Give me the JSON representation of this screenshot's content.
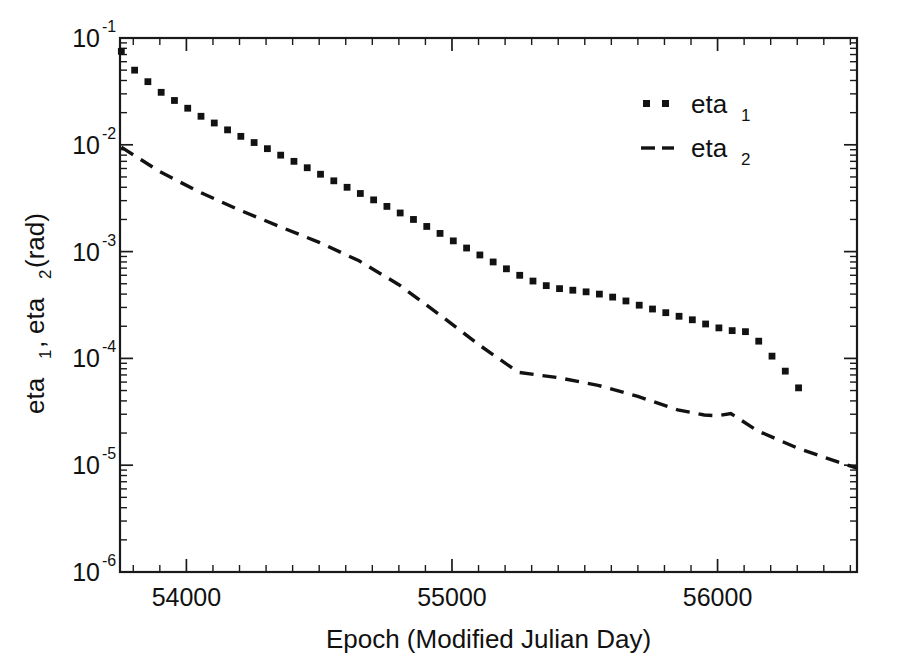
{
  "chart_data": {
    "type": "line",
    "title": "",
    "xlabel": "Epoch (Modified Julian Day)",
    "ylabel": "eta_1, eta_2 (rad)",
    "ylabel_parts": {
      "base1": "eta",
      "sub1": "1",
      "sep": ", ",
      "base2": "eta",
      "sub2": "2",
      "units": " (rad)"
    },
    "xscale": "linear",
    "yscale": "log",
    "xlim": [
      53750,
      56525
    ],
    "ylim": [
      1e-06,
      0.1
    ],
    "grid": false,
    "legend_position": "top-right",
    "xticks": [
      54000,
      55000,
      56000
    ],
    "xtick_labels": [
      "54000",
      "55000",
      "56000"
    ],
    "xminor_interval": 100,
    "yticks": [
      0.1,
      0.01,
      0.001,
      0.0001,
      1e-05,
      1e-06
    ],
    "ytick_labels": [
      "10",
      "10",
      "10",
      "10",
      "10",
      "10"
    ],
    "ytick_exponents": [
      "-1",
      "-2",
      "-3",
      "-4",
      "-5",
      "-6"
    ],
    "series": [
      {
        "name": "eta_1",
        "label_base": "eta",
        "label_sub": "1",
        "style": "dotted-markers",
        "marker": "square",
        "color": "#121212",
        "x": [
          53755,
          53805,
          53855,
          53905,
          53955,
          54005,
          54055,
          54105,
          54155,
          54205,
          54255,
          54305,
          54355,
          54405,
          54455,
          54505,
          54555,
          54605,
          54655,
          54705,
          54755,
          54805,
          54855,
          54905,
          54955,
          55005,
          55055,
          55105,
          55155,
          55205,
          55255,
          55305,
          55355,
          55405,
          55455,
          55505,
          55555,
          55605,
          55655,
          55705,
          55755,
          55805,
          55855,
          55905,
          55955,
          56005,
          56055,
          56105,
          56155,
          56205,
          56255,
          56305
        ],
        "y": [
          0.075,
          0.05,
          0.039,
          0.031,
          0.026,
          0.022,
          0.0185,
          0.016,
          0.0138,
          0.012,
          0.0105,
          0.0092,
          0.008,
          0.007,
          0.0061,
          0.0053,
          0.0046,
          0.004,
          0.0035,
          0.00305,
          0.00265,
          0.0023,
          0.002,
          0.00172,
          0.00148,
          0.00126,
          0.00108,
          0.00093,
          0.0008,
          0.00069,
          0.0006,
          0.00053,
          0.00048,
          0.00045,
          0.000435,
          0.00042,
          0.0004,
          0.000375,
          0.000345,
          0.000315,
          0.00029,
          0.000268,
          0.000248,
          0.00023,
          0.00021,
          0.000193,
          0.000182,
          0.000178,
          0.000145,
          0.000105,
          7.6e-05,
          5.3e-05
        ]
      },
      {
        "name": "eta_2",
        "label_base": "eta",
        "label_sub": "2",
        "style": "dashed",
        "color": "#121212",
        "x": [
          53755,
          53900,
          54050,
          54200,
          54350,
          54500,
          54650,
          54800,
          54950,
          55100,
          55250,
          55400,
          55550,
          55700,
          55850,
          55950,
          56000,
          56050,
          56150,
          56300,
          56450,
          56525
        ],
        "y": [
          0.0095,
          0.0056,
          0.0036,
          0.00245,
          0.00172,
          0.00122,
          0.00082,
          0.00049,
          0.00026,
          0.000135,
          7.4e-05,
          6.6e-05,
          5.6e-05,
          4.4e-05,
          3.3e-05,
          2.95e-05,
          2.9e-05,
          3.05e-05,
          2.1e-05,
          1.45e-05,
          1.08e-05,
          9.4e-06
        ]
      }
    ]
  },
  "legend": {
    "entries": [
      {
        "marker": "dotted",
        "base": "eta",
        "sub": "1"
      },
      {
        "marker": "dashed",
        "base": "eta",
        "sub": "2"
      }
    ]
  },
  "colors": {
    "background": "#ffffff",
    "ink": "#121212",
    "axis": "#1a1a1a"
  }
}
